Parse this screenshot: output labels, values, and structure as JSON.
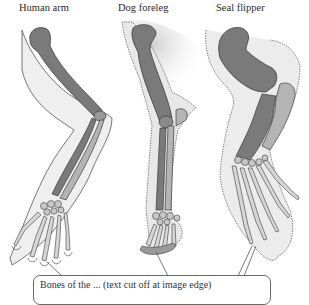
{
  "labels": {
    "human": "Human arm",
    "dog": "Dog foreleg",
    "seal": "Seal flipper"
  },
  "caption": {
    "text": "Bones of the ... (text cut off at image edge)"
  },
  "colors": {
    "bone_dark": "#7a7a7a",
    "bone_light": "#b4b4b4",
    "bone_outline": "#3c3c3c",
    "skin_fill": "#e6e6e6",
    "skin_outline": "#555555",
    "shadow": "#d0d0d0",
    "background": "#ffffff"
  }
}
